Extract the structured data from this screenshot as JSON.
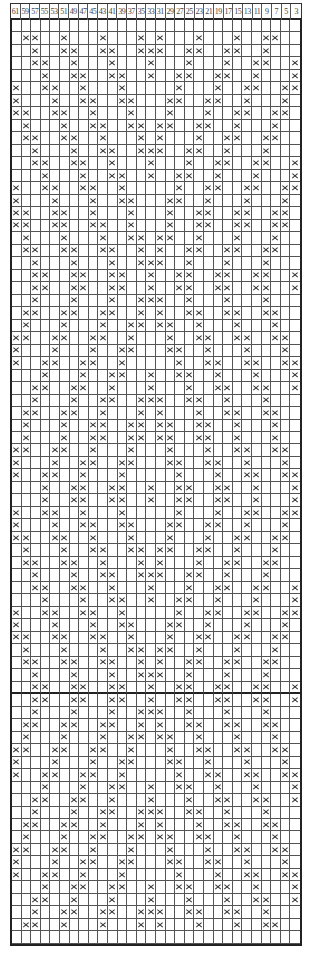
{
  "chart": {
    "column_headers": [
      "61",
      "59",
      "57",
      "55",
      "53",
      "51",
      "49",
      "47",
      "45",
      "43",
      "41",
      "39",
      "37",
      "35",
      "33",
      "31",
      "29",
      "27",
      "25",
      "23",
      "21",
      "19",
      "17",
      "15",
      "13",
      "11",
      "9",
      "7",
      "5",
      "3"
    ],
    "columns": 30,
    "symbol": "×",
    "thick_line_after_row": 54,
    "rows": [
      [],
      [
        1,
        2,
        5,
        9,
        13,
        15,
        19,
        23,
        26,
        27
      ],
      [
        2,
        5,
        6,
        9,
        10,
        13,
        14,
        15,
        18,
        19,
        22,
        23,
        26
      ],
      [
        2,
        3,
        6,
        10,
        14,
        18,
        22,
        25,
        26,
        29
      ],
      [
        3,
        6,
        7,
        10,
        11,
        14,
        17,
        18,
        21,
        22,
        25,
        29
      ],
      [
        0,
        3,
        4,
        7,
        11,
        17,
        21,
        24,
        25,
        28,
        29
      ],
      [
        0,
        4,
        7,
        8,
        11,
        12,
        16,
        17,
        20,
        21,
        24,
        28
      ],
      [
        0,
        1,
        4,
        5,
        8,
        12,
        16,
        20,
        23,
        24,
        27,
        28
      ],
      [
        1,
        5,
        8,
        9,
        12,
        13,
        15,
        16,
        19,
        20,
        23,
        27
      ],
      [
        1,
        2,
        5,
        6,
        9,
        13,
        15,
        19,
        22,
        23,
        26,
        27
      ],
      [
        2,
        6,
        9,
        10,
        13,
        14,
        15,
        18,
        19,
        22,
        26
      ],
      [
        2,
        3,
        6,
        7,
        10,
        14,
        18,
        21,
        22,
        25,
        26,
        29
      ],
      [
        3,
        7,
        10,
        11,
        14,
        17,
        18,
        21,
        25,
        29
      ],
      [
        0,
        3,
        4,
        7,
        8,
        11,
        17,
        20,
        21,
        24,
        25,
        28,
        29
      ],
      [
        0,
        4,
        8,
        11,
        12,
        16,
        17,
        20,
        24,
        28
      ],
      [
        0,
        1,
        4,
        5,
        8,
        12,
        16,
        19,
        20,
        23,
        24,
        27,
        28
      ],
      [
        0,
        1,
        4,
        5,
        8,
        9,
        12,
        16,
        19,
        20,
        23,
        24,
        27,
        28
      ],
      [
        1,
        5,
        9,
        12,
        13,
        15,
        16,
        19,
        23,
        27
      ],
      [
        1,
        2,
        5,
        6,
        9,
        10,
        13,
        15,
        18,
        19,
        22,
        23,
        26,
        27
      ],
      [
        2,
        6,
        10,
        13,
        14,
        15,
        18,
        22,
        26
      ],
      [
        2,
        3,
        6,
        7,
        10,
        11,
        14,
        17,
        18,
        21,
        22,
        25,
        26,
        29
      ],
      [
        2,
        3,
        6,
        7,
        10,
        11,
        14,
        17,
        18,
        21,
        22,
        25,
        26,
        29
      ],
      [
        2,
        6,
        10,
        13,
        14,
        15,
        18,
        22,
        26
      ],
      [
        1,
        2,
        5,
        6,
        9,
        10,
        13,
        15,
        18,
        19,
        22,
        23,
        26,
        27
      ],
      [
        1,
        5,
        9,
        12,
        13,
        15,
        16,
        19,
        23,
        27
      ],
      [
        0,
        1,
        4,
        5,
        8,
        9,
        12,
        16,
        19,
        20,
        23,
        24,
        27,
        28
      ],
      [
        0,
        4,
        8,
        11,
        12,
        16,
        17,
        20,
        24,
        28
      ],
      [
        0,
        3,
        4,
        7,
        8,
        11,
        17,
        20,
        21,
        24,
        25,
        28,
        29
      ],
      [
        3,
        7,
        10,
        11,
        14,
        17,
        18,
        21,
        25,
        29
      ],
      [
        2,
        3,
        6,
        7,
        10,
        14,
        18,
        21,
        22,
        25,
        26,
        29
      ],
      [
        2,
        6,
        9,
        10,
        13,
        14,
        15,
        18,
        19,
        22,
        26
      ],
      [
        1,
        2,
        5,
        6,
        9,
        13,
        15,
        19,
        22,
        23,
        26,
        27
      ],
      [
        1,
        5,
        8,
        9,
        12,
        13,
        15,
        16,
        19,
        20,
        23,
        27
      ],
      [
        1,
        5,
        8,
        9,
        12,
        13,
        15,
        16,
        19,
        20,
        23,
        27
      ],
      [
        0,
        1,
        4,
        5,
        8,
        12,
        16,
        20,
        23,
        24,
        27,
        28
      ],
      [
        0,
        4,
        7,
        8,
        11,
        12,
        16,
        17,
        20,
        21,
        24,
        28
      ],
      [
        0,
        3,
        4,
        7,
        11,
        17,
        21,
        24,
        25,
        28,
        29
      ],
      [
        3,
        6,
        7,
        10,
        11,
        14,
        17,
        18,
        21,
        22,
        25,
        29
      ],
      [
        3,
        6,
        7,
        10,
        11,
        14,
        17,
        18,
        21,
        22,
        25,
        29
      ],
      [
        0,
        3,
        4,
        7,
        11,
        17,
        21,
        24,
        25,
        28,
        29
      ],
      [
        0,
        4,
        7,
        8,
        11,
        12,
        16,
        17,
        20,
        21,
        24,
        28
      ],
      [
        0,
        1,
        4,
        5,
        8,
        12,
        16,
        20,
        23,
        24,
        27,
        28
      ],
      [
        1,
        5,
        8,
        9,
        12,
        13,
        15,
        16,
        19,
        20,
        23,
        27
      ],
      [
        1,
        2,
        5,
        6,
        9,
        13,
        15,
        19,
        22,
        23,
        26,
        27
      ],
      [
        2,
        6,
        9,
        10,
        13,
        14,
        15,
        18,
        19,
        22,
        26
      ],
      [
        2,
        3,
        6,
        7,
        10,
        14,
        18,
        21,
        22,
        25,
        26,
        29
      ],
      [
        3,
        7,
        10,
        11,
        14,
        17,
        18,
        21,
        25,
        29
      ],
      [
        0,
        3,
        4,
        7,
        8,
        11,
        17,
        20,
        21,
        24,
        25,
        28,
        29
      ],
      [
        0,
        4,
        8,
        11,
        12,
        16,
        17,
        20,
        24,
        28
      ],
      [
        0,
        1,
        4,
        5,
        8,
        9,
        12,
        16,
        19,
        20,
        23,
        24,
        27,
        28
      ],
      [
        1,
        5,
        9,
        12,
        13,
        15,
        16,
        19,
        23,
        27
      ],
      [
        1,
        2,
        5,
        6,
        9,
        10,
        13,
        15,
        18,
        19,
        22,
        23,
        26,
        27
      ],
      [
        2,
        6,
        10,
        13,
        14,
        15,
        18,
        22,
        26
      ],
      [
        2,
        3,
        6,
        7,
        10,
        11,
        14,
        17,
        18,
        21,
        22,
        25,
        26,
        29
      ],
      [
        2,
        3,
        6,
        7,
        10,
        11,
        14,
        17,
        18,
        21,
        22,
        25,
        26,
        29
      ],
      [
        2,
        6,
        10,
        13,
        14,
        15,
        18,
        22,
        26
      ],
      [
        1,
        2,
        5,
        6,
        9,
        10,
        13,
        15,
        18,
        19,
        22,
        23,
        26,
        27
      ],
      [
        1,
        5,
        9,
        12,
        13,
        15,
        16,
        19,
        23,
        27
      ],
      [
        0,
        1,
        4,
        5,
        8,
        9,
        12,
        16,
        19,
        20,
        23,
        24,
        27,
        28
      ],
      [
        0,
        4,
        8,
        11,
        12,
        16,
        17,
        20,
        24,
        28
      ],
      [
        0,
        3,
        4,
        7,
        8,
        11,
        17,
        20,
        21,
        24,
        25,
        28,
        29
      ],
      [
        3,
        7,
        10,
        11,
        14,
        17,
        18,
        21,
        25,
        29
      ],
      [
        2,
        3,
        6,
        7,
        10,
        14,
        18,
        21,
        22,
        25,
        26,
        29
      ],
      [
        2,
        6,
        9,
        10,
        13,
        14,
        15,
        18,
        19,
        22,
        26
      ],
      [
        1,
        2,
        5,
        6,
        9,
        13,
        15,
        19,
        22,
        23,
        26,
        27
      ],
      [
        1,
        5,
        8,
        9,
        12,
        13,
        15,
        16,
        19,
        20,
        23,
        27
      ],
      [
        0,
        1,
        4,
        5,
        8,
        12,
        16,
        20,
        23,
        24,
        27,
        28
      ],
      [
        0,
        4,
        7,
        8,
        11,
        12,
        16,
        17,
        20,
        21,
        24,
        28
      ],
      [
        0,
        3,
        4,
        7,
        11,
        17,
        21,
        24,
        25,
        28,
        29
      ],
      [
        3,
        6,
        7,
        10,
        11,
        14,
        17,
        18,
        21,
        22,
        25,
        29
      ],
      [
        2,
        3,
        6,
        10,
        14,
        18,
        22,
        25,
        26,
        29
      ],
      [
        2,
        5,
        6,
        9,
        10,
        13,
        14,
        15,
        18,
        19,
        22,
        23,
        26
      ],
      [
        1,
        2,
        5,
        9,
        13,
        15,
        19,
        23,
        26,
        27
      ],
      []
    ]
  }
}
